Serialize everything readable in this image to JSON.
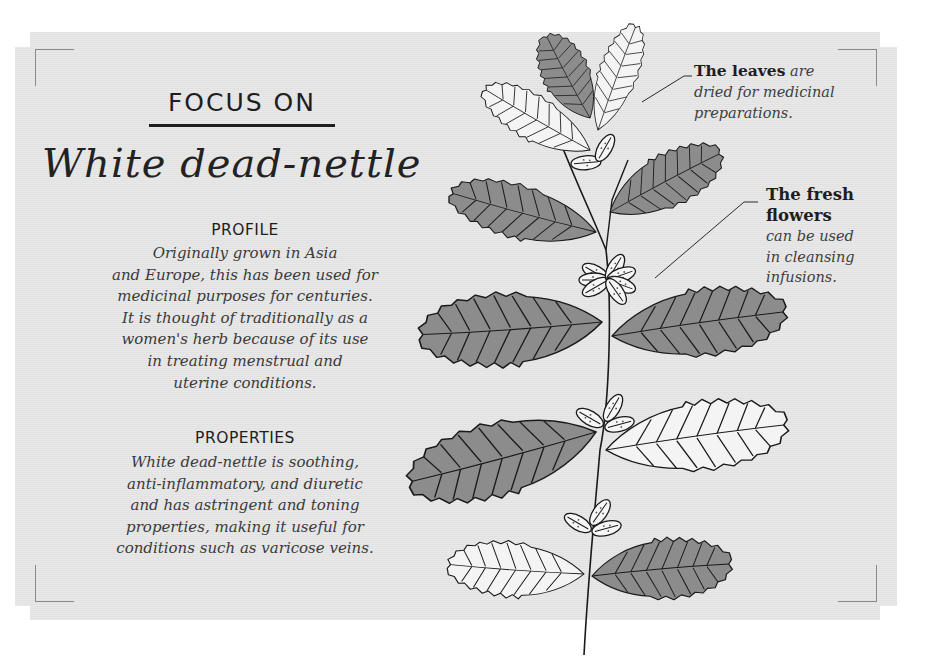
{
  "header": {
    "kicker": "FOCUS ON",
    "title": "White dead-nettle"
  },
  "profile": {
    "heading": "PROFILE",
    "lines": [
      "Originally grown in Asia",
      "and Europe, this has been used for",
      "medicinal purposes for centuries.",
      "It is thought of traditionally as a",
      "women's herb because of its use",
      "in treating menstrual and",
      "uterine conditions."
    ]
  },
  "properties": {
    "heading": "PROPERTIES",
    "lines": [
      "White dead-nettle is soothing,",
      "anti-inflammatory, and diuretic",
      "and has astringent and toning",
      "properties, making it useful for",
      "conditions such as varicose veins."
    ]
  },
  "callouts": {
    "leaves": {
      "bold": "The leaves",
      "italic_1": "are",
      "italic_2": "dried for medicinal",
      "italic_3": "preparations."
    },
    "flowers": {
      "bold_1": "The fresh",
      "bold_2": "flowers",
      "italic_1": "can be used",
      "italic_2": "in cleansing",
      "italic_3": "infusions."
    }
  },
  "illustration": {
    "subject": "white-dead-nettle-plant",
    "leaf_dark": "#8c8c8c",
    "leaf_light": "#f4f4f4",
    "stroke": "#1a1a1a"
  },
  "colors": {
    "card_bg": "#e6e6e6",
    "text_dark": "#1e1e1e",
    "text_body": "#3a3a3a",
    "bracket": "#8a8a8a"
  }
}
